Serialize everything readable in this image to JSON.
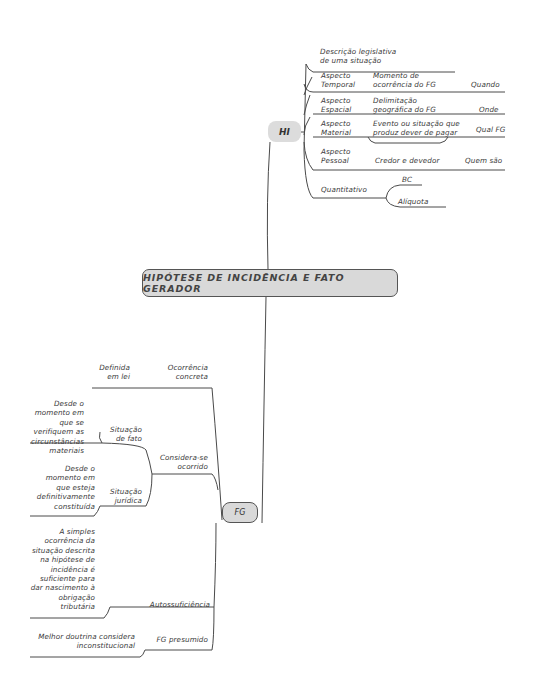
{
  "central_topic": "HIPÓTESE DE INCIDÊNCIA E FATO GERADOR",
  "hi": {
    "label": "HI",
    "definition": "Descrição legislativa\nde uma situação",
    "aspects": [
      {
        "name": "Aspecto\nTemporal",
        "description": "Momento de\nocorrência do FG",
        "answer": "Quando"
      },
      {
        "name": "Aspecto\nEspacial",
        "description": "Delimitação\ngeográfica do FG",
        "answer": "Onde"
      },
      {
        "name": "Aspecto\nMaterial",
        "description": "Evento ou situação que\nproduz dever de pagar",
        "answer": "Qual FG"
      },
      {
        "name": "Aspecto\nPessoal",
        "description": "Credor e devedor",
        "answer": "Quem são"
      }
    ],
    "quantitative": {
      "name": "Quantitativo",
      "children": [
        "BC",
        "Alíquota"
      ]
    }
  },
  "fg": {
    "label": "FG",
    "branches": [
      {
        "name": "Ocorrência\nconcreta",
        "detail": "Definida\nem lei"
      },
      {
        "name": "Considera-se\nocorrido",
        "children": [
          {
            "name": "Situação\nde fato",
            "detail": "Desde o\nmomento em\nque se\nverifiquem as\ncircunstâncias\nmateriais"
          },
          {
            "name": "Situação\njurídica",
            "detail": "Desde o\nmomento em\nque esteja\ndefinitivamente\nconstituída"
          }
        ]
      },
      {
        "name": "Autossuficiência",
        "detail": "A simples\nocorrência da\nsituação descrita\nna hipótese de\nincidência é\nsuficiente para\ndar nascimento à\nobrigação\ntributária"
      },
      {
        "name": "FG presumido",
        "detail": "Melhor doutrina considera\ninconstitucional"
      }
    ]
  },
  "colors": {
    "node_fill": "#d9d9d9",
    "line": "#444444",
    "text": "#3a3a3a"
  }
}
